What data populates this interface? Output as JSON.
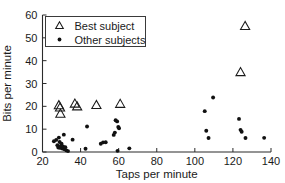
{
  "chart_data": {
    "type": "scatter",
    "title": "",
    "xlabel": "Taps per minute",
    "ylabel": "Bits per minute",
    "xlim": [
      20,
      140
    ],
    "ylim": [
      0,
      60
    ],
    "xticks": [
      20,
      40,
      60,
      80,
      100,
      120,
      140
    ],
    "yticks": [
      0,
      10,
      20,
      30,
      40,
      50,
      60
    ],
    "grid": false,
    "legend_position": "upper left",
    "series": [
      {
        "name": "Best subject",
        "marker": "triangle",
        "points": [
          [
            28.6,
            20.3
          ],
          [
            29.2,
            19.3
          ],
          [
            29.4,
            16.6
          ],
          [
            37.0,
            21.0
          ],
          [
            38.2,
            19.8
          ],
          [
            48.3,
            20.4
          ],
          [
            60.8,
            20.9
          ],
          [
            124.0,
            34.8
          ],
          [
            126.4,
            55.0
          ]
        ]
      },
      {
        "name": "Other subjects",
        "marker": "dot",
        "points": [
          [
            26.0,
            4.7
          ],
          [
            27.2,
            5.3
          ],
          [
            27.8,
            3.0
          ],
          [
            28.3,
            2.0
          ],
          [
            28.6,
            6.3
          ],
          [
            29.0,
            4.4
          ],
          [
            29.3,
            1.8
          ],
          [
            29.6,
            2.6
          ],
          [
            30.0,
            3.6
          ],
          [
            30.4,
            1.5
          ],
          [
            30.8,
            2.4
          ],
          [
            31.2,
            7.6
          ],
          [
            31.5,
            1.2
          ],
          [
            32.0,
            2.1
          ],
          [
            32.6,
            0.7
          ],
          [
            33.4,
            0.4
          ],
          [
            35.8,
            5.4
          ],
          [
            42.6,
            1.4
          ],
          [
            43.4,
            11.2
          ],
          [
            50.6,
            3.6
          ],
          [
            51.8,
            4.2
          ],
          [
            53.2,
            4.3
          ],
          [
            57.4,
            7.5
          ],
          [
            58.0,
            8.5
          ],
          [
            58.4,
            13.9
          ],
          [
            59.2,
            13.4
          ],
          [
            59.8,
            11.0
          ],
          [
            60.2,
            10.4
          ],
          [
            59.4,
            0.5
          ],
          [
            65.6,
            1.6
          ],
          [
            105.2,
            17.9
          ],
          [
            106.0,
            9.3
          ],
          [
            107.2,
            6.1
          ],
          [
            109.6,
            23.9
          ],
          [
            123.2,
            14.5
          ],
          [
            124.0,
            9.7
          ],
          [
            124.6,
            8.9
          ],
          [
            126.6,
            6.1
          ],
          [
            136.4,
            6.2
          ]
        ]
      }
    ]
  },
  "legend": {
    "entries": [
      {
        "label": "Best subject",
        "marker": "triangle-marker"
      },
      {
        "label": "Other subjects",
        "marker": "dot-marker"
      }
    ]
  },
  "colors": {
    "axis": "#2b2b2b",
    "marker": "#111111",
    "background": "#ffffff"
  }
}
